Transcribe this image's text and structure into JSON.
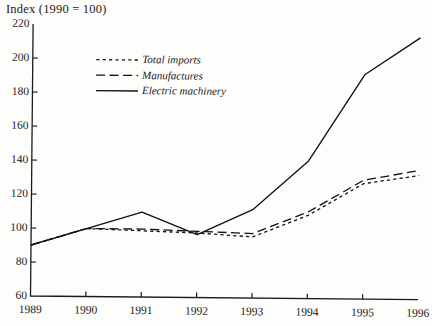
{
  "chart_data": {
    "type": "line",
    "title": "Index (1990 = 100)",
    "xlabel": "",
    "ylabel": "",
    "x": [
      1989,
      1990,
      1991,
      1992,
      1993,
      1994,
      1995,
      1996
    ],
    "xticklabels": [
      "1989",
      "1990",
      "1991",
      "1992",
      "1993",
      "1994",
      "1995",
      "1996"
    ],
    "yticks": [
      60,
      80,
      100,
      120,
      140,
      160,
      180,
      200,
      220
    ],
    "yticklabels": [
      "60",
      "80",
      "100",
      "120",
      "140",
      "160",
      "180",
      "200",
      "220"
    ],
    "xlim": [
      1989,
      1996
    ],
    "ylim": [
      60,
      220
    ],
    "grid": false,
    "legend_position": "upper-left-inside",
    "series": [
      {
        "name": "Total imports",
        "style": "dotted",
        "color": "#111111",
        "values": [
          90,
          100,
          99,
          98,
          96,
          109,
          128,
          133
        ]
      },
      {
        "name": "Manufactures",
        "style": "dashed",
        "color": "#111111",
        "values": [
          90,
          100,
          100,
          99,
          98,
          111,
          130,
          136
        ]
      },
      {
        "name": "Electric machinery",
        "style": "solid",
        "color": "#111111",
        "values": [
          90,
          100,
          110,
          97,
          112,
          141,
          192,
          214
        ]
      }
    ]
  },
  "legend": {
    "items": [
      {
        "label": "Total imports",
        "style": "dotted"
      },
      {
        "label": "Manufactures",
        "style": "dashed"
      },
      {
        "label": "Electric machinery",
        "style": "solid"
      }
    ]
  },
  "axes": {
    "axis_color": "#1a1a1a",
    "tick_length": 5
  }
}
